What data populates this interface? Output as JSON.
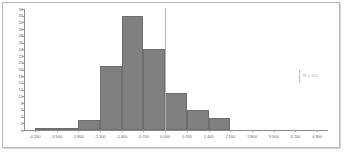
{
  "chart_data": {
    "type": "bar",
    "title": "",
    "subtitle": "",
    "xlabel": "",
    "ylabel": "",
    "grid": false,
    "legend_position": "right",
    "xlim": [
      -4.55,
      5.25
    ],
    "ylim": [
      0,
      36
    ],
    "x_tick_labels": [
      "-4 200",
      "-3 500",
      "-2 800",
      "-2 100",
      "-1 400",
      "-0 700",
      "0 000",
      "0 700",
      "1 400",
      "2 100",
      "2 800",
      "3 500",
      "4 200",
      "4 900"
    ],
    "x_tick_values": [
      -4.2,
      -3.5,
      -2.8,
      -2.1,
      -1.4,
      -0.7,
      0.0,
      0.7,
      1.4,
      2.1,
      2.8,
      3.5,
      4.2,
      4.9
    ],
    "y_tick_labels": [
      "36",
      "34",
      "32",
      "30",
      "28",
      "26",
      "24",
      "22",
      "20",
      "18",
      "16",
      "14",
      "12",
      "10",
      "8",
      "6",
      "4",
      "2",
      "0"
    ],
    "y_tick_values": [
      36,
      34,
      32,
      30,
      28,
      26,
      24,
      22,
      20,
      18,
      16,
      14,
      12,
      10,
      8,
      6,
      4,
      2,
      0
    ],
    "bar_color": "#808080",
    "bar_edge_color": "#6e6e6e",
    "axis_color": "#8a8a8a",
    "label_color": "#6b6b6b",
    "categories": [
      "-3 850",
      "-3 150",
      "-2 450",
      "-1 750",
      "-1 050",
      "-0 350",
      "0 350",
      "1 050",
      "1 750"
    ],
    "bin_centers": [
      -3.85,
      -3.15,
      -2.45,
      -1.75,
      -1.05,
      -0.35,
      0.35,
      1.05,
      1.75
    ],
    "bin_width": 0.7,
    "values": [
      0.3,
      0.6,
      3,
      19,
      34,
      24,
      11,
      6,
      3.5
    ],
    "annotations": [
      {
        "text": "N = 101",
        "x": 4.55,
        "y": 16
      }
    ]
  },
  "annotation": {
    "text": "N = 101"
  }
}
